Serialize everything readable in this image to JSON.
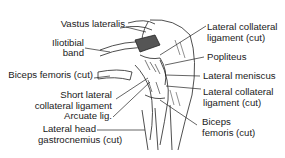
{
  "figure": {
    "labels_left": [
      {
        "id": "vastus-lateralis",
        "lines": [
          "Vastus lateralis"
        ]
      },
      {
        "id": "iliotibial-band",
        "lines": [
          "Iliotibial",
          "band"
        ]
      },
      {
        "id": "biceps-femoris-cut-left",
        "lines": [
          "Biceps femoris (cut)"
        ]
      },
      {
        "id": "short-lateral-collateral-ligament",
        "lines": [
          "Short lateral",
          "collateral ligament"
        ]
      },
      {
        "id": "arcuate-lig",
        "lines": [
          "Arcuate lig."
        ]
      },
      {
        "id": "lateral-head-gastrocnemius",
        "lines": [
          "Lateral head",
          "gastrocnemius (cut)"
        ]
      }
    ],
    "labels_right": [
      {
        "id": "lateral-collateral-ligament-cut-top",
        "lines": [
          "Lateral collateral",
          "ligament (cut)"
        ]
      },
      {
        "id": "popliteus",
        "lines": [
          "Popliteus"
        ]
      },
      {
        "id": "lateral-meniscus",
        "lines": [
          "Lateral meniscus"
        ]
      },
      {
        "id": "lateral-collateral-ligament-cut-bottom",
        "lines": [
          "Lateral collateral",
          "ligament (cut)"
        ]
      },
      {
        "id": "biceps-femoris-cut-right",
        "lines": [
          "Biceps",
          "femoris (cut)"
        ]
      }
    ]
  }
}
